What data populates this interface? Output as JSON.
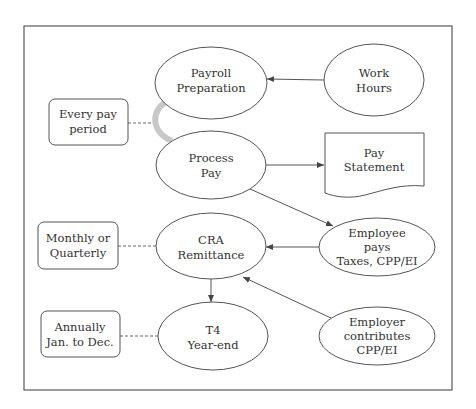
{
  "diagram": {
    "type": "payroll-process-flow",
    "colors": {
      "stroke": "#555555",
      "text": "#333333",
      "cycle_arrow": "#c8c8c8",
      "background": "#ffffff"
    },
    "nodes": {
      "payroll_preparation": {
        "shape": "ellipse",
        "line1": "Payroll",
        "line2": "Preparation"
      },
      "work_hours": {
        "shape": "ellipse",
        "line1": "Work",
        "line2": "Hours"
      },
      "process_pay": {
        "shape": "ellipse",
        "line1": "Process",
        "line2": "Pay"
      },
      "pay_statement": {
        "shape": "document",
        "line1": "Pay",
        "line2": "Statement"
      },
      "cra_remittance": {
        "shape": "ellipse",
        "line1": "CRA",
        "line2": "Remittance"
      },
      "employee_pays": {
        "shape": "ellipse",
        "line1": "Employee",
        "line2": "pays",
        "line3": "Taxes, CPP/EI"
      },
      "t4_year_end": {
        "shape": "ellipse",
        "line1": "T4",
        "line2": "Year-end"
      },
      "employer_contributes": {
        "shape": "ellipse",
        "line1": "Employer",
        "line2": "contributes",
        "line3": "CPP/EI"
      }
    },
    "frequency_notes": {
      "every_pay_period": {
        "line1": "Every pay",
        "line2": "period"
      },
      "monthly_quarterly": {
        "line1": "Monthly or",
        "line2": "Quarterly"
      },
      "annually": {
        "line1": "Annually",
        "line2": "Jan. to Dec."
      }
    },
    "edges": [
      {
        "from": "Work Hours",
        "to": "Payroll Preparation",
        "style": "solid-arrow"
      },
      {
        "from": "Payroll Preparation",
        "to": "Process Pay",
        "style": "grey-cycle-arrow"
      },
      {
        "from": "Process Pay",
        "to": "Pay Statement",
        "style": "solid-arrow"
      },
      {
        "from": "Process Pay",
        "to": "Employee pays Taxes, CPP/EI",
        "style": "solid-arrow"
      },
      {
        "from": "Employee pays Taxes, CPP/EI",
        "to": "CRA Remittance",
        "style": "solid-arrow"
      },
      {
        "from": "Employer contributes CPP/EI",
        "to": "CRA Remittance",
        "style": "solid-arrow"
      },
      {
        "from": "CRA Remittance",
        "to": "T4 Year-end",
        "style": "solid-arrow"
      },
      {
        "from": "Every pay period",
        "to": "Payroll cycle",
        "style": "dashed"
      },
      {
        "from": "Monthly or Quarterly",
        "to": "CRA Remittance",
        "style": "dashed"
      },
      {
        "from": "Annually Jan. to Dec.",
        "to": "T4 Year-end",
        "style": "dashed"
      }
    ]
  }
}
